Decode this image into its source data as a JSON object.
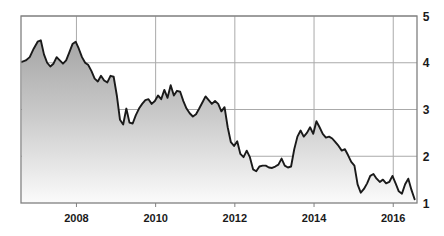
{
  "chart_data": {
    "type": "area",
    "title": "",
    "subtitle": "",
    "xlabel": "",
    "ylabel": "",
    "xlim": [
      2006.6,
      2016.6
    ],
    "ylim": [
      1,
      5
    ],
    "grid": true,
    "legend": null,
    "x_ticks": [
      "2008",
      "2010",
      "2012",
      "2014",
      "2016"
    ],
    "x_tick_values": [
      2008,
      2010,
      2012,
      2014,
      2016
    ],
    "y_ticks": [
      "1",
      "2",
      "3",
      "4",
      "5"
    ],
    "y_tick_values": [
      1,
      2,
      3,
      4,
      5
    ],
    "series": [
      {
        "name": "value",
        "line_color": "#1a1a1a",
        "fill_top_color": "#a6a6a6",
        "fill_bottom_color": "#fbfbfb",
        "x": [
          2006.62,
          2006.72,
          2006.82,
          2006.92,
          2007.02,
          2007.1,
          2007.18,
          2007.26,
          2007.34,
          2007.42,
          2007.5,
          2007.58,
          2007.66,
          2007.74,
          2007.82,
          2007.9,
          2007.98,
          2008.06,
          2008.14,
          2008.22,
          2008.3,
          2008.38,
          2008.46,
          2008.54,
          2008.62,
          2008.7,
          2008.78,
          2008.86,
          2008.94,
          2009.02,
          2009.1,
          2009.18,
          2009.26,
          2009.34,
          2009.42,
          2009.5,
          2009.58,
          2009.66,
          2009.74,
          2009.82,
          2009.9,
          2009.98,
          2010.06,
          2010.14,
          2010.22,
          2010.3,
          2010.38,
          2010.46,
          2010.54,
          2010.62,
          2010.7,
          2010.78,
          2010.86,
          2010.94,
          2011.02,
          2011.1,
          2011.18,
          2011.26,
          2011.34,
          2011.42,
          2011.5,
          2011.58,
          2011.66,
          2011.74,
          2011.82,
          2011.9,
          2011.98,
          2012.06,
          2012.14,
          2012.22,
          2012.3,
          2012.38,
          2012.46,
          2012.54,
          2012.62,
          2012.7,
          2012.78,
          2012.86,
          2012.94,
          2013.02,
          2013.1,
          2013.18,
          2013.26,
          2013.34,
          2013.42,
          2013.5,
          2013.58,
          2013.66,
          2013.74,
          2013.82,
          2013.9,
          2013.98,
          2014.06,
          2014.14,
          2014.22,
          2014.3,
          2014.38,
          2014.46,
          2014.54,
          2014.62,
          2014.7,
          2014.78,
          2014.86,
          2014.94,
          2015.02,
          2015.1,
          2015.18,
          2015.26,
          2015.34,
          2015.42,
          2015.5,
          2015.58,
          2015.66,
          2015.74,
          2015.82,
          2015.9,
          2015.98,
          2016.06,
          2016.14,
          2016.22,
          2016.3,
          2016.38,
          2016.46,
          2016.54
        ],
        "y": [
          4.02,
          4.05,
          4.12,
          4.3,
          4.45,
          4.48,
          4.18,
          4.0,
          3.92,
          3.98,
          4.12,
          4.05,
          3.98,
          4.05,
          4.22,
          4.4,
          4.45,
          4.3,
          4.12,
          4.0,
          3.95,
          3.82,
          3.66,
          3.6,
          3.72,
          3.62,
          3.58,
          3.72,
          3.7,
          3.3,
          2.78,
          2.68,
          3.02,
          2.72,
          2.7,
          2.88,
          3.02,
          3.12,
          3.2,
          3.22,
          3.12,
          3.18,
          3.3,
          3.22,
          3.42,
          3.25,
          3.52,
          3.3,
          3.4,
          3.38,
          3.18,
          3.02,
          2.92,
          2.85,
          2.9,
          3.02,
          3.15,
          3.28,
          3.2,
          3.12,
          3.18,
          3.12,
          2.96,
          3.05,
          2.62,
          2.3,
          2.22,
          2.32,
          2.05,
          1.98,
          2.12,
          1.98,
          1.72,
          1.68,
          1.78,
          1.8,
          1.8,
          1.76,
          1.75,
          1.78,
          1.82,
          1.95,
          1.8,
          1.76,
          1.78,
          2.15,
          2.42,
          2.55,
          2.42,
          2.5,
          2.62,
          2.48,
          2.75,
          2.62,
          2.48,
          2.4,
          2.42,
          2.38,
          2.3,
          2.22,
          2.12,
          2.15,
          2.02,
          1.88,
          1.8,
          1.4,
          1.22,
          1.3,
          1.42,
          1.58,
          1.62,
          1.52,
          1.45,
          1.5,
          1.42,
          1.45,
          1.58,
          1.42,
          1.25,
          1.2,
          1.4,
          1.52,
          1.28,
          1.08
        ]
      }
    ]
  },
  "axes": {
    "plot_left": 21,
    "plot_right": 417,
    "plot_top": 16,
    "plot_bottom": 203,
    "frame_color": "#808080",
    "grid_color": "#aaaaaa"
  }
}
